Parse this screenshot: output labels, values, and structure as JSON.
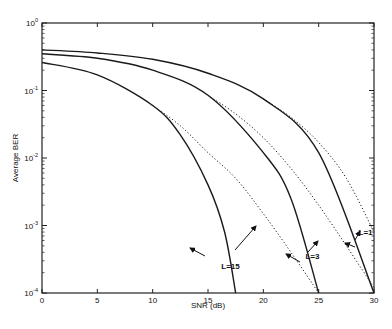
{
  "chart_data": {
    "type": "line",
    "title": "",
    "xlabel": "SNR (dB)",
    "ylabel": "Average BER",
    "xlim": [
      0,
      30
    ],
    "ylim": [
      0.0001,
      1
    ],
    "yscale": "log",
    "xticks": [
      0,
      5,
      10,
      15,
      20,
      25,
      30
    ],
    "yticks": [
      {
        "value": 1,
        "label": "10^0"
      },
      {
        "value": 0.1,
        "label": "10^-1"
      },
      {
        "value": 0.01,
        "label": "10^-2"
      },
      {
        "value": 0.001,
        "label": "10^-3"
      },
      {
        "value": 0.0001,
        "label": "10^-4"
      }
    ],
    "grid": false,
    "legend": "none (inline annotations with arrows)",
    "series": [
      {
        "name": "L=1 (exact)",
        "style": "solid",
        "x": [
          0,
          5,
          10,
          15,
          20,
          25,
          30
        ],
        "y": [
          0.4,
          0.36,
          0.29,
          0.18,
          0.075,
          0.012,
          0.0001
        ]
      },
      {
        "name": "L=3 (exact)",
        "style": "solid",
        "x": [
          0,
          5,
          10,
          15,
          20,
          22.5,
          25
        ],
        "y": [
          0.35,
          0.3,
          0.2,
          0.085,
          0.012,
          0.0025,
          0.0001
        ]
      },
      {
        "name": "L=15 (exact)",
        "style": "solid",
        "x": [
          0,
          5,
          10,
          12.5,
          15,
          16.5,
          17.5
        ],
        "y": [
          0.26,
          0.17,
          0.06,
          0.022,
          0.004,
          0.0008,
          0.0001
        ]
      },
      {
        "name": "L=1 (approx)",
        "style": "dotted",
        "x": [
          20,
          22.5,
          25,
          27.5,
          30
        ],
        "y": [
          0.075,
          0.04,
          0.017,
          0.005,
          0.0008
        ]
      },
      {
        "name": "L=3 (approx)",
        "style": "dotted",
        "x": [
          15,
          17.5,
          20,
          22.5,
          25,
          27.5,
          30
        ],
        "y": [
          0.085,
          0.045,
          0.02,
          0.007,
          0.002,
          0.0005,
          0.00012
        ]
      },
      {
        "name": "L=15 (approx)",
        "style": "dotted",
        "x": [
          10,
          12.5,
          15,
          17.5,
          20,
          22.5,
          25
        ],
        "y": [
          0.06,
          0.03,
          0.012,
          0.005,
          0.0015,
          0.0004,
          0.0001
        ]
      }
    ],
    "annotations": [
      {
        "text": "L=15",
        "x": 16.2,
        "y": 0.00025
      },
      {
        "text": "L=3",
        "x": 23.8,
        "y": 0.00035
      },
      {
        "text": "L=1",
        "x": 28.6,
        "y": 0.0008
      }
    ]
  }
}
